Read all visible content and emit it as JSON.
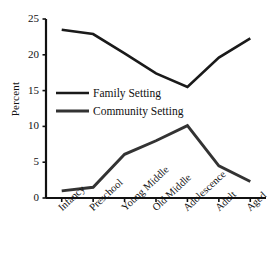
{
  "chart_data": {
    "type": "line",
    "title": "",
    "xlabel": "",
    "ylabel": "Percent",
    "ylim": [
      0,
      25
    ],
    "yticks": [
      0,
      5,
      10,
      15,
      20,
      25
    ],
    "grid": false,
    "legend_position": "center-left",
    "categories": [
      "Infancy",
      "Preschool",
      "Young Middle",
      "Old Middle",
      "Adolescence",
      "Adult",
      "Aged"
    ],
    "series": [
      {
        "name": "Family Setting",
        "color": "#1a1a1a",
        "values": [
          23.5,
          22.9,
          20.2,
          17.4,
          15.5,
          19.6,
          22.3
        ]
      },
      {
        "name": "Community Setting",
        "color": "#333333",
        "values": [
          1.0,
          1.5,
          6.1,
          8.0,
          10.1,
          4.5,
          2.3
        ]
      }
    ]
  },
  "axis": {
    "y_title": "Percent",
    "y_tick_labels": [
      "0",
      "5",
      "10",
      "15",
      "20",
      "25"
    ]
  },
  "legend": {
    "entries": [
      {
        "label": "Family Setting"
      },
      {
        "label": "Community Setting"
      }
    ]
  }
}
